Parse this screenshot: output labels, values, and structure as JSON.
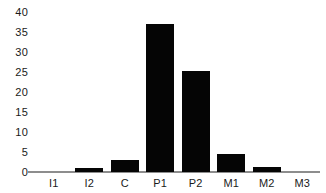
{
  "chart_data": {
    "type": "bar",
    "title": "",
    "subtitle": "",
    "xlabel": "",
    "ylabel": "",
    "categories": [
      "I1",
      "I2",
      "C",
      "P1",
      "P2",
      "M1",
      "M2",
      "M3"
    ],
    "values": [
      0,
      1,
      3,
      37,
      25.3,
      4.5,
      1.3,
      0
    ],
    "series": [
      {
        "name": "",
        "values": [
          0,
          1,
          3,
          37,
          25.3,
          4.5,
          1.3,
          0
        ]
      }
    ],
    "ylim": [
      0,
      40
    ],
    "y_ticks": [
      0,
      5,
      10,
      15,
      20,
      25,
      30,
      35,
      40
    ],
    "y_tick_labels": [
      "0",
      "5",
      "10",
      "15",
      "20",
      "25",
      "30",
      "35",
      "40"
    ],
    "grid": false,
    "legend": false,
    "legend_position": "none",
    "bar_color": "#050505",
    "axis_color": "#8d8d8d",
    "background_color": "#ffffff",
    "text_color": "#1a1a1a",
    "annotations": []
  }
}
